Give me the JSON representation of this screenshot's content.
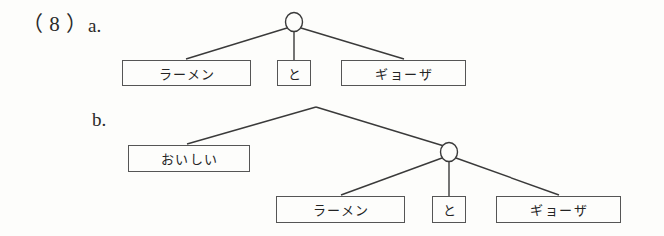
{
  "figure": {
    "example_number": "（ 8 ）",
    "background_color": "#fdfdfb",
    "line_color": "#3a3a3a",
    "box_border_color": "#555555",
    "text_color": "#242424"
  },
  "trees": [
    {
      "id": "tree-a",
      "label": "a.",
      "root_node": {
        "shape": "circle",
        "label": ""
      },
      "leaves": [
        {
          "id": "a-leaf-1",
          "text": "ラーメン"
        },
        {
          "id": "a-leaf-2",
          "text": "と"
        },
        {
          "id": "a-leaf-3",
          "text": "ギョーザ"
        }
      ]
    },
    {
      "id": "tree-b",
      "label": "b.",
      "root_node": {
        "shape": "apex",
        "label": ""
      },
      "inner_node": {
        "shape": "circle",
        "label": ""
      },
      "leaves": [
        {
          "id": "b-leaf-0",
          "text": "おいしい"
        },
        {
          "id": "b-leaf-1",
          "text": "ラーメン"
        },
        {
          "id": "b-leaf-2",
          "text": "と"
        },
        {
          "id": "b-leaf-3",
          "text": "ギョーザ"
        }
      ]
    }
  ]
}
